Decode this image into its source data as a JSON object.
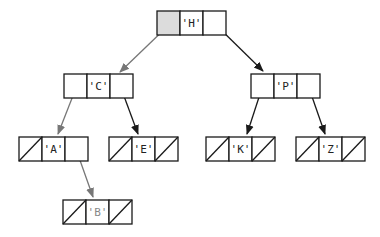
{
  "diagram": {
    "title": "",
    "colors": {
      "line": "#1a1a1a",
      "highlight_arrow": "#777777",
      "highlight_fill": "#dcdcdc",
      "text": "#222222",
      "faded_text": "#888888"
    },
    "nodes": [
      {
        "id": "H",
        "label": "'H'",
        "x": 157,
        "y": 11,
        "left": "ptr",
        "right": "ptr",
        "left_fill": true
      },
      {
        "id": "C",
        "label": "'C'",
        "x": 64,
        "y": 74,
        "left": "ptr",
        "right": "ptr"
      },
      {
        "id": "P",
        "label": "'P'",
        "x": 251,
        "y": 74,
        "left": "ptr",
        "right": "ptr"
      },
      {
        "id": "A",
        "label": "'A'",
        "x": 19,
        "y": 137,
        "left": "null",
        "right": "ptr"
      },
      {
        "id": "E",
        "label": "'E'",
        "x": 109,
        "y": 137,
        "left": "null",
        "right": "null"
      },
      {
        "id": "K",
        "label": "'K'",
        "x": 206,
        "y": 137,
        "left": "null",
        "right": "null"
      },
      {
        "id": "Z",
        "label": "'Z'",
        "x": 296,
        "y": 137,
        "left": "null",
        "right": "null"
      },
      {
        "id": "B",
        "label": "'B'",
        "x": 63,
        "y": 200,
        "left": "null",
        "right": "null",
        "faded": true
      }
    ],
    "edges": [
      {
        "from": "H",
        "to": "C",
        "x1": 172,
        "y1": 22,
        "x2": 120,
        "y2": 72,
        "highlight": true
      },
      {
        "from": "H",
        "to": "P",
        "x1": 213,
        "y1": 22,
        "x2": 263,
        "y2": 71,
        "highlight": false
      },
      {
        "from": "C",
        "to": "A",
        "x1": 76,
        "y1": 88,
        "x2": 58,
        "y2": 134,
        "highlight": true
      },
      {
        "from": "C",
        "to": "E",
        "x1": 121,
        "y1": 88,
        "x2": 138,
        "y2": 134,
        "highlight": false
      },
      {
        "from": "P",
        "to": "K",
        "x1": 262,
        "y1": 88,
        "x2": 247,
        "y2": 134,
        "highlight": false
      },
      {
        "from": "P",
        "to": "Z",
        "x1": 309,
        "y1": 88,
        "x2": 325,
        "y2": 134,
        "highlight": false
      },
      {
        "from": "A",
        "to": "B",
        "x1": 76,
        "y1": 149,
        "x2": 93,
        "y2": 197,
        "highlight": true
      }
    ]
  }
}
